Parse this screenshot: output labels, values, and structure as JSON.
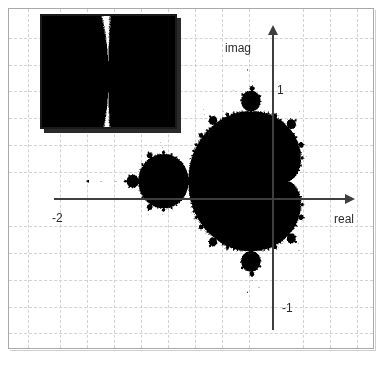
{
  "figure": {
    "kind": "mandelbrot-set-plot",
    "background_color": "#ffffff",
    "frame_color": "#a9a9a9",
    "grid_color": "#d2d2d2",
    "axis_color": "#3f3f3f",
    "fractal_color": "#000000"
  },
  "axes": {
    "real_axis_label": "real",
    "imag_axis_label": "imag",
    "real_axis_arrow": "arrow-right",
    "imag_axis_arrow": "arrow-up"
  },
  "ticks": {
    "real_negative_two": "-2",
    "imag_positive_one": "1",
    "imag_negative_one": "-1"
  },
  "inset": {
    "caption": "",
    "border_color": "#1a1a1a",
    "shadow_color": "#2a2a2a"
  },
  "chart_data": {
    "type": "scatter",
    "title": "",
    "subtitle": "",
    "xlabel": "real",
    "ylabel": "imag",
    "xlim": [
      -2.55,
      1.1
    ],
    "ylim": [
      -1.55,
      1.6
    ],
    "grid": true,
    "grid_style": "dashed",
    "legend": null,
    "x_ticks": [
      -2
    ],
    "x_tick_labels": [
      "-2"
    ],
    "y_ticks": [
      1,
      -1
    ],
    "y_tick_labels": [
      "1",
      "-1"
    ],
    "annotations": [
      {
        "text": "imag",
        "role": "y-axis-label"
      },
      {
        "text": "real",
        "role": "x-axis-label"
      },
      {
        "text": "1",
        "role": "y-tick-label"
      },
      {
        "text": "-1",
        "role": "y-tick-label"
      },
      {
        "text": "-2",
        "role": "x-tick-label"
      }
    ],
    "series": [
      {
        "name": "Mandelbrot set",
        "description": "Points c in the complex plane for which the orbit of z->z^2+c remains bounded",
        "max_iterations": 200,
        "escape_radius": 2,
        "fill_color": "#000000",
        "view": {
          "x_min": -2.55,
          "x_max": 1.1,
          "y_min": -1.55,
          "y_max": 1.6
        }
      }
    ],
    "inset_chart": {
      "type": "scatter",
      "name": "Mandelbrot detail (zoom)",
      "description": "Magnified region of the Mandelbrot set boundary near the negative real axis showing self-similar filament structure",
      "max_iterations": 200,
      "escape_radius": 2,
      "view": {
        "x_min": -0.81,
        "x_max": -0.69,
        "y_min": -0.05,
        "y_max": 0.06
      }
    }
  }
}
